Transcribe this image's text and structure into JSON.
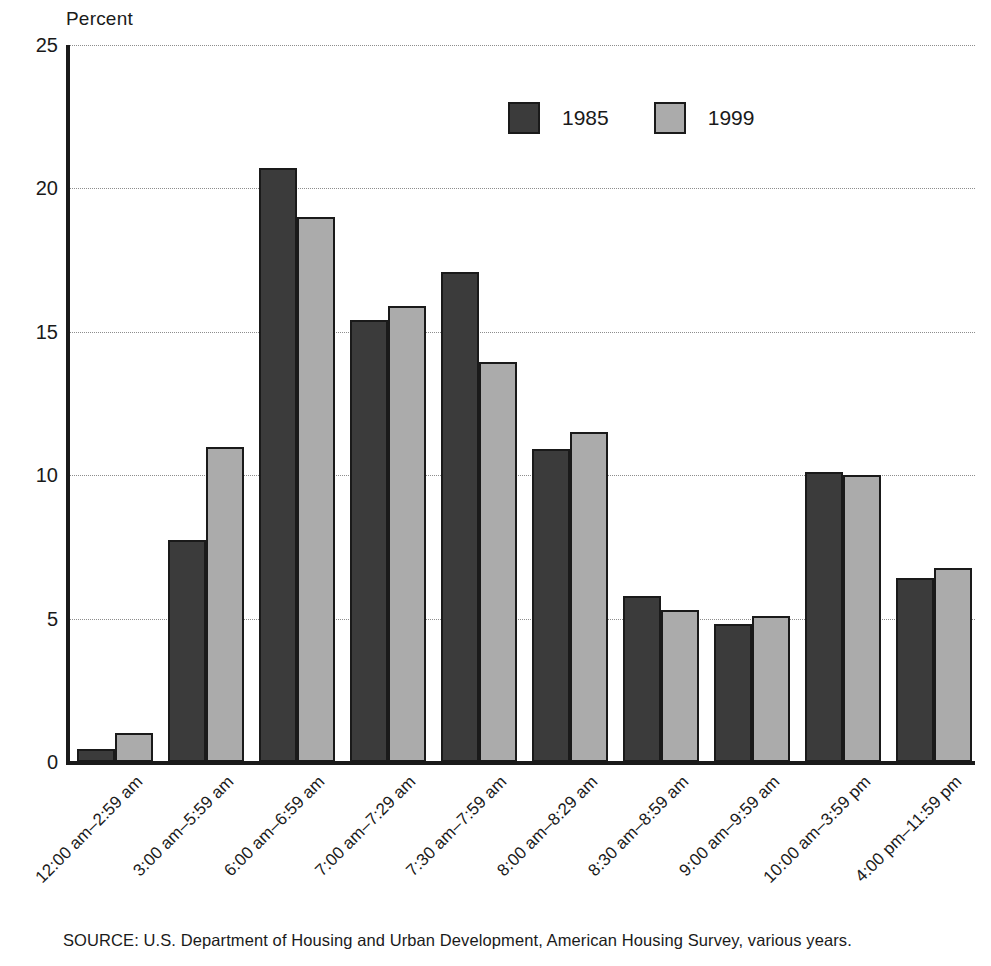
{
  "chart_data": {
    "type": "bar",
    "title": "",
    "ylabel": "Percent",
    "xlabel": "",
    "ylim": [
      0,
      25
    ],
    "yticks": [
      0,
      5,
      10,
      15,
      20,
      25
    ],
    "grid": true,
    "legend_position": "top-center",
    "categories": [
      "12:00 am–2:59 am",
      "3:00 am–5:59 am",
      "6:00 am–6:59 am",
      "7:00 am–7:29 am",
      "7:30 am–7:59 am",
      "8:00 am–8:29 am",
      "8:30 am–8:59 am",
      "9:00 am–9:59 am",
      "10:00 am–3:59 pm",
      "4:00 pm–11:59 pm"
    ],
    "series": [
      {
        "name": "1985",
        "color": "#3b3b3b",
        "values": [
          0.45,
          7.75,
          20.7,
          15.4,
          17.1,
          10.9,
          5.8,
          4.8,
          10.1,
          6.4
        ]
      },
      {
        "name": "1999",
        "color": "#ababab",
        "values": [
          1.0,
          11.0,
          19.0,
          15.9,
          13.95,
          11.5,
          5.3,
          5.1,
          10.0,
          6.75
        ]
      }
    ],
    "source_note": "SOURCE: U.S. Department of Housing and Urban Development, American Housing Survey, various years."
  }
}
